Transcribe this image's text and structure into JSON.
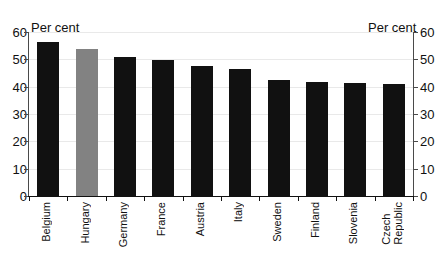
{
  "chart_data": {
    "type": "bar",
    "title": "",
    "subtitle": "",
    "xlabel": "",
    "ylabel": "Per cent",
    "ylabel_right": "Per cent",
    "ylim": [
      0,
      60
    ],
    "ytick_step": 10,
    "grid": true,
    "legend": "none",
    "categories": [
      "Belgium",
      "Hungary",
      "Germany",
      "France",
      "Austria",
      "Italy",
      "Sweden",
      "Finland",
      "Slovenia",
      "Czech Republic"
    ],
    "values": [
      56.4,
      53.8,
      50.9,
      49.8,
      47.6,
      46.5,
      42.5,
      41.8,
      41.2,
      40.9
    ],
    "highlight_category": "Hungary",
    "bar_color": "#111111",
    "highlight_color": "#828282",
    "ytick_labels_left": [
      "60",
      "50",
      "40",
      "30",
      "20",
      "10",
      "0"
    ],
    "ytick_labels_right": [
      "60",
      "50",
      "40",
      "30",
      "20",
      "10",
      "0"
    ],
    "ytick_values": [
      60,
      50,
      40,
      30,
      20,
      10,
      0
    ]
  },
  "axes": {
    "unit_caption_left": "Per cent",
    "unit_caption_right": "Per cent"
  },
  "categories_wrapped": [
    [
      "Belgium"
    ],
    [
      "Hungary"
    ],
    [
      "Germany"
    ],
    [
      "France"
    ],
    [
      "Austria"
    ],
    [
      "Italy"
    ],
    [
      "Sweden"
    ],
    [
      "Finland"
    ],
    [
      "Slovenia"
    ],
    [
      "Czech",
      "Republic"
    ]
  ]
}
